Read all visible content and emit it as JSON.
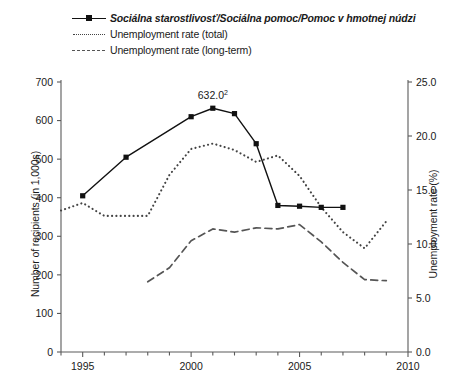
{
  "chart_data": {
    "type": "line",
    "title": "",
    "xlabel": "",
    "ylabel": "Number of recipients (in 1,000s)",
    "y2label": "Unemployment rate (%)",
    "xlim": [
      1994,
      2010
    ],
    "ylim": [
      0,
      700
    ],
    "y2lim": [
      0.0,
      25.0
    ],
    "xticks": [
      1995,
      2000,
      2005,
      2010
    ],
    "xtick_labels": [
      "1995",
      "2000",
      "2005",
      "2010"
    ],
    "xminor_step": 1,
    "yticks": [
      0,
      100,
      200,
      300,
      400,
      500,
      600,
      700
    ],
    "ytick_labels": [
      "0",
      "100",
      "200",
      "300",
      "400",
      "500",
      "600",
      "700"
    ],
    "y2ticks": [
      0.0,
      5.0,
      10.0,
      15.0,
      20.0,
      25.0
    ],
    "y2tick_labels": [
      "0.0",
      "5.0",
      "10.0",
      "15.0",
      "20.0",
      "25.0"
    ],
    "grid": false,
    "legend_position": "top-left",
    "annotations": [
      {
        "text": "632.0",
        "superscript": "2",
        "x": 2001,
        "y": 632,
        "axis": "left"
      }
    ],
    "series": [
      {
        "name": "Sociálna starostlivosť/Sociálna pomoc/Pomoc v hmotnej núdzi",
        "axis": "left",
        "style": "solid-with-square-markers",
        "color": "#111111",
        "italic_label": true,
        "x": [
          1995,
          1997,
          2000,
          2001,
          2002,
          2003,
          2004,
          2005,
          2006,
          2007
        ],
        "values": [
          405,
          505,
          610,
          632,
          618,
          540,
          380,
          378,
          375,
          375
        ]
      },
      {
        "name": "Unemployment rate (total)",
        "axis": "right",
        "style": "dotted",
        "color": "#444444",
        "italic_label": false,
        "x": [
          1994,
          1995,
          1996,
          1997,
          1998,
          1999,
          2000,
          2001,
          2002,
          2003,
          2004,
          2005,
          2006,
          2007,
          2008,
          2009
        ],
        "values": [
          13.1,
          13.8,
          12.6,
          12.6,
          12.6,
          16.4,
          18.8,
          19.3,
          18.7,
          17.6,
          18.2,
          16.3,
          13.4,
          11.1,
          9.6,
          12.1
        ]
      },
      {
        "name": "Unemployment rate (long-term)",
        "axis": "right",
        "style": "dashed",
        "color": "#555555",
        "italic_label": false,
        "x": [
          1998,
          1999,
          2000,
          2001,
          2002,
          2003,
          2004,
          2005,
          2006,
          2007,
          2008,
          2009
        ],
        "values": [
          6.5,
          7.8,
          10.3,
          11.4,
          11.1,
          11.5,
          11.4,
          11.8,
          10.2,
          8.3,
          6.7,
          6.6
        ]
      }
    ]
  },
  "legend": {
    "items": [
      {
        "label": "Sociálna starostlivosť/Sociálna pomoc/Pomoc v hmotnej núdzi"
      },
      {
        "label": "Unemployment rate (total)"
      },
      {
        "label": "Unemployment rate (long-term)"
      }
    ]
  },
  "axes": {
    "left_title": "Number of recipients (in 1,000s)",
    "right_title": "Unemployment rate (%)"
  }
}
